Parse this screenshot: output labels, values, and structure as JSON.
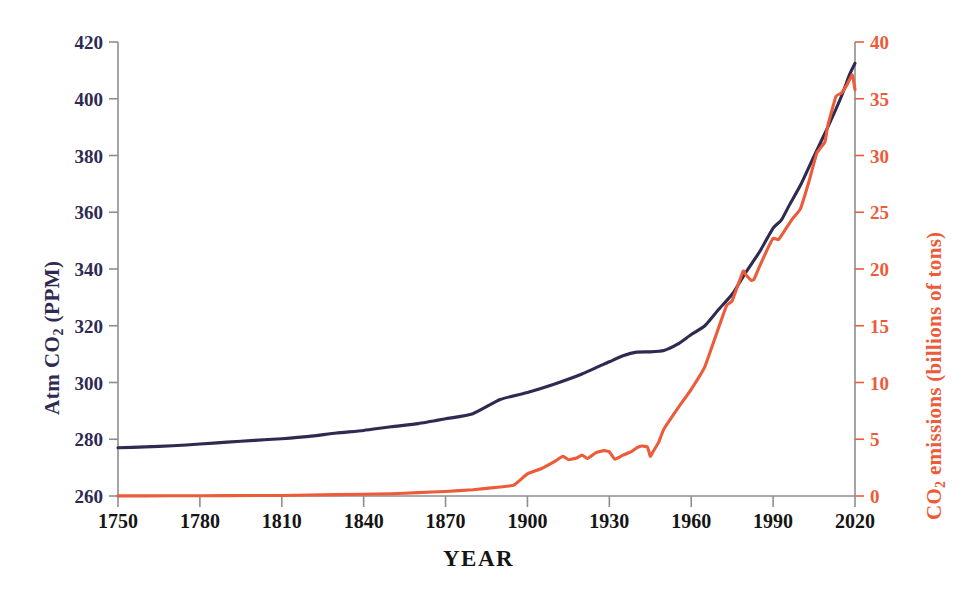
{
  "chart_data": {
    "type": "line",
    "title": "",
    "xlabel": "YEAR",
    "ylabel": "Atm CO2  (PPM)",
    "y2label": "CO2 emissions (billions of tons)",
    "grid": false,
    "legend": "none",
    "xlim": [
      1750,
      2020
    ],
    "ylim": [
      260,
      420
    ],
    "y2lim": [
      0,
      40
    ],
    "xticks": [
      1750,
      1780,
      1810,
      1840,
      1870,
      1900,
      1930,
      1960,
      1990,
      2020
    ],
    "yticks": [
      260,
      280,
      300,
      320,
      340,
      360,
      380,
      400,
      420
    ],
    "y2ticks": [
      0,
      5,
      10,
      15,
      20,
      25,
      30,
      35,
      40
    ],
    "axis_left_label_parts": {
      "pre": "Atm  CO",
      "sub": "2",
      "post": "  (PPM)"
    },
    "axis_right_label_parts": {
      "pre": "CO",
      "sub": "2",
      "post": " emissions (billions of tons)"
    },
    "colors": {
      "concentration": "#2e2a52",
      "emissions": "#ec5b3a",
      "axis": "#8e8e8e",
      "x_axis_text": "#151515"
    },
    "series": [
      {
        "name": "Atm CO2 (PPM)",
        "axis": "left",
        "color": "#2e2a52",
        "units": "PPM",
        "x": [
          1750,
          1760,
          1770,
          1780,
          1790,
          1800,
          1810,
          1820,
          1830,
          1840,
          1850,
          1860,
          1870,
          1880,
          1890,
          1900,
          1910,
          1920,
          1930,
          1935,
          1940,
          1945,
          1950,
          1955,
          1960,
          1965,
          1970,
          1975,
          1980,
          1985,
          1990,
          1993,
          1996,
          2000,
          2005,
          2010,
          2015,
          2018,
          2020
        ],
        "values": [
          277.0,
          277.3,
          277.7,
          278.3,
          279.0,
          279.6,
          280.2,
          281.0,
          282.2,
          283.1,
          284.4,
          285.5,
          287.2,
          289.0,
          294.0,
          296.5,
          299.5,
          303.0,
          307.3,
          309.4,
          310.7,
          310.8,
          311.3,
          313.5,
          316.9,
          320.0,
          325.7,
          331.1,
          338.8,
          346.0,
          354.4,
          357.2,
          362.6,
          369.5,
          379.8,
          389.9,
          400.8,
          408.5,
          412.5
        ]
      },
      {
        "name": "CO2 emissions (billions of tons)",
        "axis": "right",
        "color": "#ec5b3a",
        "units": "billions of tons",
        "x": [
          1750,
          1770,
          1790,
          1810,
          1830,
          1850,
          1860,
          1870,
          1880,
          1890,
          1895,
          1900,
          1905,
          1910,
          1913,
          1915,
          1918,
          1920,
          1922,
          1925,
          1928,
          1930,
          1932,
          1935,
          1938,
          1940,
          1942,
          1944,
          1945,
          1946,
          1948,
          1950,
          1955,
          1960,
          1965,
          1970,
          1973,
          1975,
          1979,
          1980,
          1982,
          1983,
          1985,
          1988,
          1990,
          1992,
          1994,
          1997,
          2000,
          2003,
          2006,
          2009,
          2010,
          2013,
          2015,
          2017,
          2019,
          2020
        ],
        "values": [
          0.01,
          0.02,
          0.03,
          0.05,
          0.12,
          0.2,
          0.3,
          0.4,
          0.55,
          0.8,
          0.95,
          1.95,
          2.4,
          3.05,
          3.5,
          3.2,
          3.35,
          3.6,
          3.3,
          3.8,
          4.0,
          3.9,
          3.25,
          3.6,
          3.9,
          4.25,
          4.4,
          4.3,
          3.5,
          3.9,
          4.7,
          5.9,
          7.7,
          9.4,
          11.4,
          14.8,
          16.8,
          17.2,
          19.8,
          19.5,
          19.0,
          19.1,
          20.2,
          21.8,
          22.7,
          22.6,
          23.3,
          24.4,
          25.3,
          27.6,
          30.2,
          31.2,
          32.6,
          35.2,
          35.5,
          36.2,
          37.1,
          35.8
        ]
      }
    ]
  },
  "axis_labels": {
    "x_title": "YEAR",
    "left_ticks": [
      "420",
      "400",
      "380",
      "360",
      "340",
      "320",
      "300",
      "280",
      "260"
    ],
    "right_ticks": [
      "40",
      "35",
      "30",
      "25",
      "20",
      "15",
      "10",
      "5",
      "0"
    ],
    "x_ticks": [
      "1750",
      "1780",
      "1810",
      "1840",
      "1870",
      "1900",
      "1930",
      "1960",
      "1990",
      "2020"
    ],
    "left_title_pre": "Atm  CO",
    "left_title_sub": "2",
    "left_title_post": "  (PPM)",
    "right_title_pre": "CO",
    "right_title_sub": "2",
    "right_title_post": " emissions (billions of tons)"
  }
}
